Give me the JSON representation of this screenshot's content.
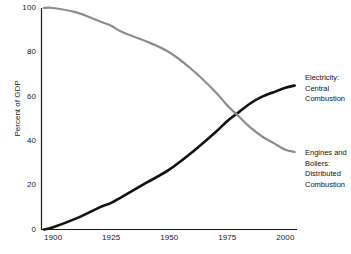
{
  "chart_data": {
    "type": "line",
    "title": "",
    "subtitle": "",
    "xlabel": "",
    "ylabel": "Percent of GDP",
    "xlim": [
      1895,
      2005
    ],
    "ylim": [
      0,
      100
    ],
    "grid": false,
    "legend_position": "right-inline-annotations",
    "xticks": [
      "1900",
      "1925",
      "1950",
      "1975",
      "2000"
    ],
    "xtick_values": [
      1900,
      1925,
      1950,
      1975,
      2000
    ],
    "yticks": [
      "0",
      "20",
      "40",
      "60",
      "80",
      "100"
    ],
    "ytick_values": [
      0,
      20,
      40,
      60,
      80,
      100
    ],
    "series": [
      {
        "name": "Electricity: Central Combustion",
        "color": "#111111",
        "label_lines": [
          "Electricity:",
          "Central",
          "Combustion"
        ],
        "x": [
          1896,
          1900,
          1910,
          1920,
          1925,
          1930,
          1940,
          1950,
          1960,
          1970,
          1975,
          1980,
          1985,
          1990,
          1995,
          2000,
          2004
        ],
        "values": [
          0,
          1,
          5,
          10,
          12,
          15,
          21,
          27,
          35,
          44,
          49,
          53,
          57,
          60,
          62,
          64,
          65
        ]
      },
      {
        "name": "Engines and Boilers: Distributed Combustion",
        "color": "#8c8c8c",
        "label_lines": [
          "Engines and",
          "Boilers:",
          "Distributed",
          "Combustion"
        ],
        "x": [
          1896,
          1900,
          1910,
          1920,
          1925,
          1930,
          1940,
          1950,
          1960,
          1970,
          1975,
          1980,
          1985,
          1990,
          1995,
          2000,
          2004
        ],
        "values": [
          100,
          100,
          98,
          94,
          92,
          89,
          85,
          80,
          72,
          62,
          56,
          51,
          46,
          42,
          39,
          36,
          35
        ]
      }
    ],
    "crossing_point": {
      "x": 1980,
      "y": 50
    },
    "axis_color": "#1a1a1a"
  }
}
